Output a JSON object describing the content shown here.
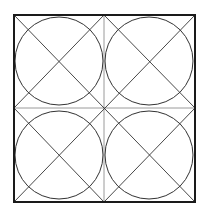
{
  "diagram": {
    "title": "",
    "background": "#ffffff",
    "stroke_color": "#333333",
    "outline_color": "#1a1a1a",
    "guide_color": "#9a9a9a",
    "square": {
      "x1": 14,
      "y1": 15,
      "x2": 195,
      "y2": 202
    },
    "center": {
      "x": 104,
      "y": 108
    },
    "quadrants": [
      {
        "name": "top-left",
        "cx": 59,
        "cy": 61,
        "r": 44
      },
      {
        "name": "top-right",
        "cx": 149,
        "cy": 61,
        "r": 44
      },
      {
        "name": "bottom-left",
        "cx": 59,
        "cy": 155,
        "r": 44
      },
      {
        "name": "bottom-right",
        "cx": 149,
        "cy": 155,
        "r": 44
      }
    ]
  }
}
